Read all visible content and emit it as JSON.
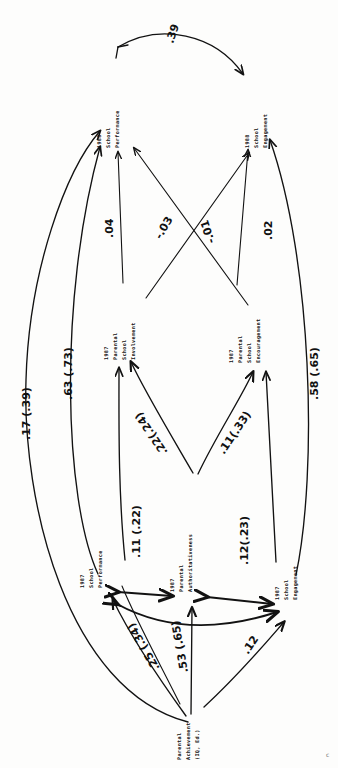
{
  "figure": {
    "type": "path-diagram",
    "orientation": "rotated-90-clockwise",
    "page_mark": "c"
  },
  "nodes": [
    {
      "id": "n1988_perf",
      "name": "1988-school-performance",
      "lines": [
        "1988",
        "School",
        "Performance"
      ]
    },
    {
      "id": "n1988_eng",
      "name": "1988-school-engagement",
      "lines": [
        "1988",
        "School",
        "Engagement"
      ]
    },
    {
      "id": "n1987_inv",
      "name": "1987-parental-school-involvement",
      "lines": [
        "1987",
        "Parental",
        "School",
        "Involvement"
      ]
    },
    {
      "id": "n1987_enc",
      "name": "1987-parental-school-encouragement",
      "lines": [
        "1987",
        "Parental",
        "School",
        "Encouragement"
      ]
    },
    {
      "id": "n1987_perf",
      "name": "1987-school-performance",
      "lines": [
        "1987",
        "School",
        "Performance"
      ]
    },
    {
      "id": "n1987_auth",
      "name": "1987-parental-authoritativeness",
      "lines": [
        "1987",
        "Parental",
        "Authoritativeness"
      ]
    },
    {
      "id": "n1987_eng",
      "name": "1987-school-engagement",
      "lines": [
        "1987",
        "School",
        "Engagement"
      ]
    },
    {
      "id": "nparent_ach",
      "name": "parental-achievement",
      "lines": [
        "Parental",
        "Achievement",
        "(IQ, Ed.)"
      ]
    }
  ],
  "coefficients": [
    {
      "id": "c_39",
      "label": ".39",
      "from": "n1988_perf",
      "to": "n1988_eng",
      "kind": "curved-correlation"
    },
    {
      "id": "c_m03",
      "label": "-.03",
      "from": "n1987_inv",
      "to": "n1988_eng",
      "kind": "cross"
    },
    {
      "id": "c_m01",
      "label": "-.01",
      "from": "n1987_enc",
      "to": "n1988_perf",
      "kind": "cross"
    },
    {
      "id": "c_04",
      "label": ".04",
      "from": "n1987_inv",
      "to": "n1988_perf",
      "kind": "direct"
    },
    {
      "id": "c_02",
      "label": ".02",
      "from": "n1987_enc",
      "to": "n1988_eng",
      "kind": "direct"
    },
    {
      "id": "c_63_73",
      "label": ".63 (.73)",
      "from": "n1987_perf",
      "to": "n1988_perf",
      "kind": "stability"
    },
    {
      "id": "c_58_65",
      "label": ".58 (.65)",
      "from": "n1987_eng",
      "to": "n1988_eng",
      "kind": "stability"
    },
    {
      "id": "c_17_39",
      "label": ".17 (.39)",
      "from": "nparent_ach",
      "to": "n1988_perf",
      "kind": "long-curve"
    },
    {
      "id": "c_22_24",
      "label": ".22(.24)",
      "from": "n1987_auth",
      "to": "n1987_inv",
      "kind": "direct"
    },
    {
      "id": "c_11_33",
      "label": ".11(.33)",
      "from": "n1987_auth",
      "to": "n1987_enc",
      "kind": "direct"
    },
    {
      "id": "c_11_22",
      "label": ".11 (.22)",
      "from": "n1987_perf",
      "to": "n1987_auth",
      "kind": "double-headed"
    },
    {
      "id": "c_12_23",
      "label": ".12(.23)",
      "from": "n1987_auth",
      "to": "n1987_eng",
      "kind": "double-headed"
    },
    {
      "id": "c_25_34",
      "label": ".25 (.34)",
      "from": "nparent_ach",
      "to": "n1987_perf",
      "kind": "direct"
    },
    {
      "id": "c_53_65",
      "label": ".53 (.65)",
      "from": "nparent_ach",
      "to": "n1987_auth",
      "kind": "direct"
    },
    {
      "id": "c_12",
      "label": ".12",
      "from": "nparent_ach",
      "to": "n1987_eng",
      "kind": "direct"
    }
  ]
}
